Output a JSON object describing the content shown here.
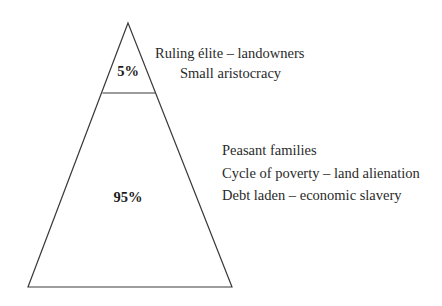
{
  "diagram": {
    "type": "pyramid",
    "colors": {
      "line": "#3a3a3a",
      "text": "#2a2a2a",
      "background": "#ffffff"
    },
    "tiers": [
      {
        "id": "top",
        "percent": "5%",
        "labels": [
          "Ruling élite – landowners",
          "Small aristocracy"
        ]
      },
      {
        "id": "bottom",
        "percent": "95%",
        "labels": [
          "Peasant families",
          "Cycle of poverty – land alienation",
          "Debt laden – economic slavery"
        ]
      }
    ]
  }
}
